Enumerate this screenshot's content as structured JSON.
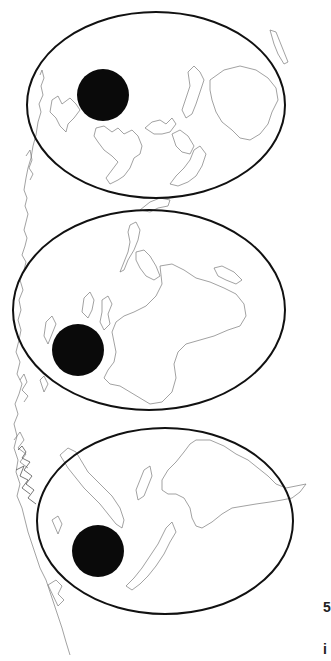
{
  "figure": {
    "type": "palaeogeographic-map-series",
    "background": "#ffffff",
    "line_color": "#111111",
    "coast_color": "#7a7a7a",
    "marker_color": "#0a0a0a",
    "panels": [
      {
        "id": "panel-1",
        "ellipse": {
          "cx": 156,
          "cy": 105,
          "rx": 129,
          "ry": 93
        },
        "marker": {
          "cx": 103,
          "cy": 95,
          "r": 26
        }
      },
      {
        "id": "panel-2",
        "ellipse": {
          "cx": 149,
          "cy": 310,
          "rx": 136,
          "ry": 100
        },
        "marker": {
          "cx": 78,
          "cy": 350,
          "r": 26
        }
      },
      {
        "id": "panel-3",
        "ellipse": {
          "cx": 165,
          "cy": 521,
          "rx": 128,
          "ry": 93
        },
        "marker": {
          "cx": 98,
          "cy": 551,
          "r": 26
        }
      }
    ]
  },
  "edge_text": {
    "fragment_1": "5",
    "fragment_2": "i"
  }
}
